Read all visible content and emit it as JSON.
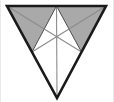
{
  "figure": {
    "title": "Downward-pointing triangle with medians and two shaded sub-triangles",
    "canvas": {
      "width": 114,
      "height": 102,
      "background": "#ffffff"
    },
    "colors": {
      "outline": "#1a1a1a",
      "median": "#8c8c8c",
      "shade_fill": "#a9a9a9",
      "shade_stroke": "#4d4d4d",
      "background": "#ffffff",
      "edge_artifact": "#e9e9e9"
    },
    "stroke_widths": {
      "outline": 2.6,
      "median": 1.1,
      "shade": 1.0
    },
    "vertices": {
      "top_left": {
        "label": "A",
        "x": 7,
        "y": 6
      },
      "top_right": {
        "label": "B",
        "x": 106,
        "y": 6
      },
      "bottom": {
        "label": "C",
        "x": 57,
        "y": 98
      }
    },
    "midpoints": {
      "top_edge": {
        "label": "M_AB",
        "x": 56.5,
        "y": 6
      },
      "right_edge": {
        "label": "M_BC",
        "x": 81.5,
        "y": 52
      },
      "left_edge": {
        "label": "M_AC",
        "x": 32,
        "y": 52
      }
    },
    "centroid": {
      "label": "G",
      "x": 56.7,
      "y": 36.7
    },
    "outline_path": "M 7 6 L 106 6 L 57 98 Z",
    "medians": [
      {
        "name": "median-from-bottom-vertex",
        "x1": 57,
        "y1": 98,
        "x2": 56.5,
        "y2": 6
      },
      {
        "name": "median-from-top-left",
        "x1": 7,
        "y1": 6,
        "x2": 81.5,
        "y2": 52
      },
      {
        "name": "median-from-top-right",
        "x1": 106,
        "y1": 6,
        "x2": 32,
        "y2": 52
      }
    ],
    "shaded_regions": [
      {
        "name": "shaded-triangle-left",
        "points": "7,6 56.5,6 32,52",
        "description": "upper-left sub-triangle bounded by left vertex, top midpoint and left-edge midpoint"
      },
      {
        "name": "shaded-triangle-right",
        "points": "106,6 56.5,6 81.5,52",
        "description": "upper-right sub-triangle bounded by right vertex, top midpoint and right-edge midpoint"
      }
    ],
    "counts": {
      "sub_triangles_total": 6,
      "sub_triangles_shaded": 2,
      "medians_drawn": 3
    }
  }
}
